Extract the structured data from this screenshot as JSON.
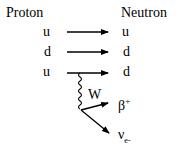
{
  "left_header": "Proton",
  "right_header": "Neutron",
  "left_quarks": [
    "u",
    "d",
    "u"
  ],
  "right_quarks": [
    "u",
    "d",
    "d"
  ],
  "boson_label": "W",
  "products": {
    "positron": {
      "base": "β",
      "sup": "+"
    },
    "neutrino": {
      "base": "ν",
      "sub": "e-"
    }
  }
}
